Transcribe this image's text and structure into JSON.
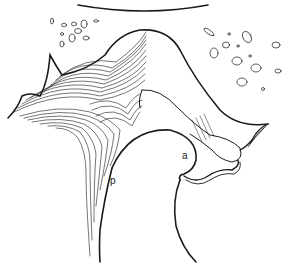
{
  "figure": {
    "type": "anatomical line drawing",
    "labels": {
      "a": "a",
      "p": "p"
    },
    "colors": {
      "stroke": "#1a1a1a",
      "background": "#ffffff"
    }
  }
}
